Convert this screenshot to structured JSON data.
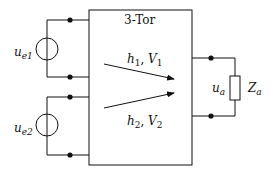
{
  "diagram": {
    "type": "circuit",
    "block": {
      "label": "3-Tor"
    },
    "sources": [
      {
        "id": "source-1",
        "symbol": "u",
        "subscript": "e1"
      },
      {
        "id": "source-2",
        "symbol": "u",
        "subscript": "e2"
      }
    ],
    "transfer_arrows": [
      {
        "id": "arrow-1",
        "symbol_h": "h",
        "sub_h": "1",
        "sep": ", ",
        "symbol_v": "V",
        "sub_v": "1"
      },
      {
        "id": "arrow-2",
        "symbol_h": "h",
        "sub_h": "2",
        "sep": ", ",
        "symbol_v": "V",
        "sub_v": "2"
      }
    ],
    "output": {
      "voltage": {
        "symbol": "u",
        "subscript": "a"
      },
      "impedance": {
        "symbol": "Z",
        "subscript": "a"
      }
    },
    "colors": {
      "line": "#111111",
      "background": "#ffffff"
    }
  }
}
